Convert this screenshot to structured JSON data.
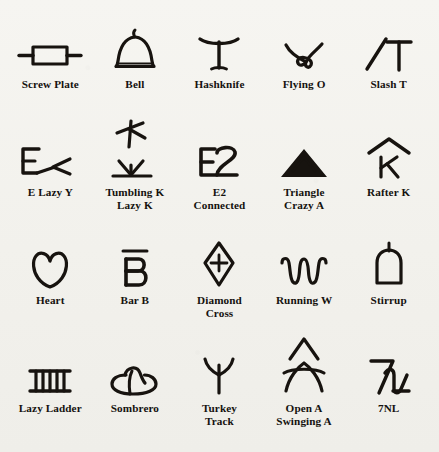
{
  "page": {
    "background_color": "#f4f3ef",
    "ink_color": "#17130f",
    "columns": 5,
    "rows": 4
  },
  "rows": [
    {
      "row_index": 1,
      "brands": [
        {
          "name": "screw-plate",
          "label": "Screw Plate",
          "icon": "screw-plate-brand"
        },
        {
          "name": "bell",
          "label": "Bell",
          "icon": "bell-brand"
        },
        {
          "name": "hashknife",
          "label": "Hashknife",
          "icon": "hashknife-brand"
        },
        {
          "name": "flying-o",
          "label": "Flying O",
          "icon": "flying-o-brand"
        },
        {
          "name": "slash-t",
          "label": "Slash T",
          "icon": "slash-t-brand"
        }
      ]
    },
    {
      "row_index": 2,
      "brands": [
        {
          "name": "e-lazy-y",
          "label": "E Lazy Y",
          "icon": "e-lazy-y-brand"
        },
        {
          "name": "tumbling-k-lazy-k",
          "label": "Tumbling K\nLazy K",
          "icon": "tumbling-k-lazy-k-brand"
        },
        {
          "name": "e2-connected",
          "label": "E2\nConnected",
          "icon": "e2-connected-brand"
        },
        {
          "name": "triangle-crazy-a",
          "label": "Triangle\nCrazy A",
          "icon": "triangle-crazy-a-brand"
        },
        {
          "name": "rafter-k",
          "label": "Rafter K",
          "icon": "rafter-k-brand"
        }
      ]
    },
    {
      "row_index": 3,
      "brands": [
        {
          "name": "heart",
          "label": "Heart",
          "icon": "heart-brand"
        },
        {
          "name": "bar-b",
          "label": "Bar B",
          "icon": "bar-b-brand"
        },
        {
          "name": "diamond-cross",
          "label": "Diamond\nCross",
          "icon": "diamond-cross-brand"
        },
        {
          "name": "running-w",
          "label": "Running W",
          "icon": "running-w-brand"
        },
        {
          "name": "stirrup",
          "label": "Stirrup",
          "icon": "stirrup-brand"
        }
      ]
    },
    {
      "row_index": 4,
      "brands": [
        {
          "name": "lazy-ladder",
          "label": "Lazy Ladder",
          "icon": "lazy-ladder-brand"
        },
        {
          "name": "sombrero",
          "label": "Sombrero",
          "icon": "sombrero-brand"
        },
        {
          "name": "turkey-track",
          "label": "Turkey\nTrack",
          "icon": "turkey-track-brand"
        },
        {
          "name": "open-a-swinging-a",
          "label": "Open A\nSwinging A",
          "icon": "open-a-swinging-a-brand"
        },
        {
          "name": "7nl",
          "label": "7NL",
          "icon": "sevennl-brand"
        }
      ]
    }
  ]
}
